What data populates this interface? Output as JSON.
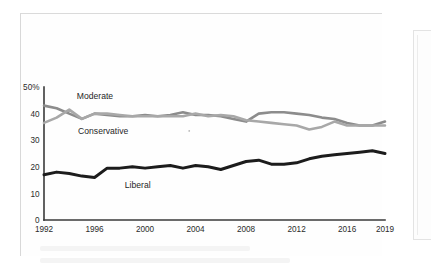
{
  "figure": {
    "kind": "line-chart",
    "background_color": "#ffffff",
    "page_frame_color": "#d8d8d8"
  },
  "chart_data": {
    "type": "line",
    "title": "",
    "subtitle": "",
    "xlabel": "",
    "ylabel": "",
    "xlim": [
      1992,
      2019
    ],
    "ylim": [
      0,
      50
    ],
    "grid": false,
    "legend": "inline-labels",
    "y_ticks": [
      "0",
      "10",
      "20",
      "30",
      "40",
      "50%"
    ],
    "y_tick_values": [
      0,
      10,
      20,
      30,
      40,
      50
    ],
    "x_ticks": [
      "1992",
      "1996",
      "2000",
      "2004",
      "2008",
      "2012",
      "2016",
      "2019"
    ],
    "x_tick_values": [
      1992,
      1996,
      2000,
      2004,
      2008,
      2012,
      2016,
      2019
    ],
    "x": [
      1992,
      1993,
      1994,
      1995,
      1996,
      1997,
      1998,
      1999,
      2000,
      2001,
      2002,
      2003,
      2004,
      2005,
      2006,
      2007,
      2008,
      2009,
      2010,
      2011,
      2012,
      2013,
      2014,
      2015,
      2016,
      2017,
      2018,
      2019
    ],
    "series": [
      {
        "name": "Moderate",
        "color": "#8c8c8c",
        "stroke_width": 2.6,
        "label_x": 1994.6,
        "label_y": 45.5,
        "values": [
          43,
          42,
          40,
          38,
          40,
          39.5,
          39,
          39,
          39.5,
          39,
          39.5,
          40.5,
          39.5,
          39.5,
          39,
          38,
          37,
          40,
          40.5,
          40.5,
          40,
          39.5,
          38.5,
          38,
          36.5,
          35.5,
          35.5,
          37
        ]
      },
      {
        "name": "Conservative",
        "color": "#a8a8a8",
        "stroke_width": 2.6,
        "label_x": 1994.7,
        "label_y": 32.5,
        "values": [
          36.5,
          38.5,
          41.5,
          38,
          40,
          40,
          39.5,
          39,
          39,
          39,
          39,
          39,
          40,
          39,
          39.5,
          39,
          37.5,
          37,
          36.5,
          36,
          35.5,
          34,
          35,
          37,
          35.5,
          35.5,
          35.5,
          35.5
        ]
      },
      {
        "name": "Liberal",
        "color": "#1c1c1c",
        "stroke_width": 3.0,
        "label_x": 1998.4,
        "label_y": 12.2,
        "values": [
          17,
          18,
          17.5,
          16.5,
          16,
          19.5,
          19.5,
          20,
          19.5,
          20,
          20.5,
          19.5,
          20.5,
          20,
          19,
          20.5,
          22,
          22.5,
          21,
          21,
          21.5,
          23,
          24,
          24.5,
          25,
          25.5,
          26,
          25
        ]
      }
    ]
  },
  "annotations": {
    "speck_x": 2003.5,
    "speck_y": 33.5
  }
}
